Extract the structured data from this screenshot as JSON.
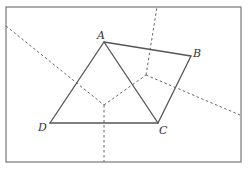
{
  "diagram": {
    "type": "geometry-voronoi-partition",
    "frame": {
      "x1": 6,
      "y1": 7,
      "x2": 241,
      "y2": 162
    },
    "points": [
      {
        "id": "A",
        "label": "A",
        "x": 104,
        "y": 42,
        "lx": 97,
        "ly": 39
      },
      {
        "id": "B",
        "label": "B",
        "x": 191,
        "y": 56,
        "lx": 193,
        "ly": 57
      },
      {
        "id": "C",
        "label": "C",
        "x": 158,
        "y": 123,
        "lx": 159,
        "ly": 134
      },
      {
        "id": "D",
        "label": "D",
        "x": 50,
        "y": 123,
        "lx": 38,
        "ly": 131
      }
    ],
    "solid_segments": [
      {
        "from": "A",
        "to": "B"
      },
      {
        "from": "B",
        "to": "C"
      },
      {
        "from": "C",
        "to": "D"
      },
      {
        "from": "D",
        "to": "A"
      },
      {
        "from": "A",
        "to": "C"
      }
    ],
    "dashed_segments": [
      {
        "x1": 6,
        "y1": 26,
        "x2": 104,
        "y2": 105
      },
      {
        "x1": 104,
        "y1": 105,
        "x2": 104,
        "y2": 162
      },
      {
        "x1": 104,
        "y1": 105,
        "x2": 146,
        "y2": 75
      },
      {
        "x1": 146,
        "y1": 75,
        "x2": 157,
        "y2": 7
      },
      {
        "x1": 146,
        "y1": 75,
        "x2": 240,
        "y2": 115
      }
    ],
    "colors": {
      "frame": "#777777",
      "solid": "#555555",
      "dashed": "#666666",
      "label": "#333333"
    }
  }
}
